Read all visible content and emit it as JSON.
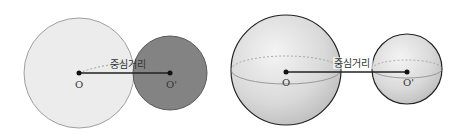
{
  "left_figure": {
    "type": "circles",
    "center_distance_label": "중심거리",
    "big_circle": {
      "center_label": "O",
      "fill": "#ececec",
      "stroke": "#9a9a9a"
    },
    "small_circle": {
      "center_label": "O'",
      "fill": "#7a7a7a",
      "stroke": "#555555"
    }
  },
  "right_figure": {
    "type": "spheres",
    "center_distance_label": "중심거리",
    "big_sphere": {
      "center_label": "O",
      "fill": "#d8d8d8",
      "stroke": "#222222"
    },
    "small_sphere": {
      "center_label": "O'",
      "fill": "#d8d8d8",
      "stroke": "#222222"
    }
  }
}
